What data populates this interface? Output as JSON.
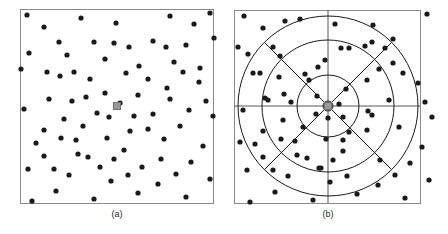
{
  "figure": {
    "title": "",
    "panels": [
      {
        "id": "a",
        "caption": "(a)",
        "description": "uniform scatter of sample points with reference point marker",
        "box": {
          "x": 20,
          "y": 9,
          "width": 193,
          "height": 194
        },
        "border_color": "#8a8a8a",
        "point_color": "#1a1a1a",
        "point_radius": 2.6,
        "center_marker": {
          "x": 117,
          "y": 106,
          "size": 7,
          "fill": "#9a9a9a",
          "stroke": "#6f6f6f"
        }
      },
      {
        "id": "b",
        "caption": "(b)",
        "description": "log-polar bins overlaid on the same sample points",
        "box": {
          "x": 234,
          "y": 10,
          "width": 186,
          "height": 193
        },
        "border_color": "#8a8a8a",
        "point_color": "#1a1a1a",
        "point_radius": 2.6,
        "center_marker": {
          "x": 328,
          "y": 106,
          "size": 7,
          "fill": "#9a9a9a",
          "stroke": "#6f6f6f"
        },
        "grid_color": "#1a1a1a",
        "axis_color": "#555555"
      }
    ]
  },
  "chart_data": {
    "type": "scatter",
    "title": "",
    "subtitle": "",
    "xlabel": "",
    "ylabel": "",
    "grid": false,
    "legend": null,
    "annotations": [
      "(a)",
      "(b)"
    ],
    "panel_a": {
      "xlim": [
        0,
        193
      ],
      "ylim": [
        0,
        194
      ],
      "reference_point": [
        97,
        97
      ],
      "points": [
        [
          150,
          7
        ],
        [
          94,
          34
        ],
        [
          118,
          86
        ],
        [
          166,
          36
        ],
        [
          174,
          15
        ],
        [
          39,
          33
        ],
        [
          74,
          33
        ],
        [
          144,
          130
        ],
        [
          54,
          63
        ],
        [
          194,
          29
        ],
        [
          119,
          57
        ],
        [
          180,
          59
        ],
        [
          85,
          84
        ],
        [
          114,
          107
        ],
        [
          66,
          88
        ],
        [
          147,
          79
        ],
        [
          122,
          158
        ],
        [
          169,
          101
        ],
        [
          106,
          64
        ],
        [
          1,
          60
        ],
        [
          29,
          90
        ],
        [
          44,
          110
        ],
        [
          77,
          104
        ],
        [
          87,
          129
        ],
        [
          24,
          147
        ],
        [
          68,
          148
        ],
        [
          49,
          166
        ],
        [
          91,
          172
        ],
        [
          118,
          184
        ],
        [
          156,
          165
        ],
        [
          183,
          137
        ],
        [
          166,
          188
        ],
        [
          24,
          121
        ],
        [
          56,
          131
        ],
        [
          104,
          141
        ],
        [
          133,
          105
        ],
        [
          160,
          117
        ],
        [
          186,
          92
        ],
        [
          193,
          107
        ],
        [
          179,
          73
        ],
        [
          154,
          53
        ],
        [
          133,
          32
        ],
        [
          96,
          14
        ],
        [
          61,
          9
        ],
        [
          24,
          18
        ],
        [
          9,
          44
        ],
        [
          4,
          100
        ],
        [
          8,
          160
        ],
        [
          36,
          182
        ],
        [
          74,
          190
        ],
        [
          110,
          122
        ],
        [
          89,
          108
        ],
        [
          70,
          70
        ],
        [
          52,
          92
        ],
        [
          40,
          67
        ],
        [
          100,
          94
        ],
        [
          128,
          70
        ],
        [
          150,
          90
        ],
        [
          171,
          153
        ],
        [
          141,
          150
        ],
        [
          108,
          166
        ],
        [
          80,
          158
        ],
        [
          58,
          145
        ],
        [
          34,
          160
        ],
        [
          16,
          134
        ],
        [
          27,
          63
        ],
        [
          47,
          46
        ],
        [
          63,
          117
        ],
        [
          94,
          150
        ],
        [
          128,
          120
        ],
        [
          146,
          38
        ],
        [
          190,
          170
        ],
        [
          7,
          6
        ],
        [
          190,
          4
        ],
        [
          12,
          192
        ],
        [
          163,
          63
        ],
        [
          85,
          50
        ],
        [
          109,
          38
        ],
        [
          41,
          129
        ],
        [
          138,
          175
        ]
      ]
    },
    "panel_b": {
      "xlim": [
        -93,
        93
      ],
      "ylim": [
        -96,
        97
      ],
      "center": [
        0,
        0
      ],
      "bin_radii": [
        5,
        31,
        66,
        90
      ],
      "sector_count": 8,
      "sector_angles_deg": [
        0,
        45,
        90,
        135,
        180,
        225,
        270,
        315
      ],
      "points": [
        [
          -43,
          85
        ],
        [
          13,
          58
        ],
        [
          -11,
          10
        ],
        [
          37,
          60
        ],
        [
          45,
          81
        ],
        [
          -90,
          59
        ],
        [
          -55,
          59
        ],
        [
          15,
          -34
        ],
        [
          -75,
          33
        ],
        [
          65,
          67
        ],
        [
          -10,
          39
        ],
        [
          51,
          37
        ],
        [
          -44,
          12
        ],
        [
          15,
          -11
        ],
        [
          -63,
          8
        ],
        [
          18,
          17
        ],
        [
          -7,
          -62
        ],
        [
          40,
          -5
        ],
        [
          -23,
          32
        ],
        [
          -88,
          -36
        ],
        [
          -60,
          6
        ],
        [
          -45,
          -14
        ],
        [
          -12,
          -8
        ],
        [
          -2,
          -33
        ],
        [
          -65,
          -51
        ],
        [
          -21,
          -52
        ],
        [
          -40,
          -70
        ],
        [
          2,
          -76
        ],
        [
          29,
          -88
        ],
        [
          67,
          -69
        ],
        [
          94,
          -41
        ],
        [
          77,
          -92
        ],
        [
          -65,
          -25
        ],
        [
          -33,
          -35
        ],
        [
          15,
          -45
        ],
        [
          44,
          -9
        ],
        [
          71,
          -21
        ],
        [
          97,
          4
        ],
        [
          104,
          -11
        ],
        [
          90,
          23
        ],
        [
          65,
          43
        ],
        [
          44,
          64
        ],
        [
          7,
          82
        ],
        [
          -28,
          87
        ],
        [
          -65,
          78
        ],
        [
          -80,
          52
        ],
        [
          -85,
          -4
        ],
        [
          -81,
          -64
        ],
        [
          -53,
          -86
        ],
        [
          -15,
          -94
        ],
        [
          21,
          -26
        ],
        [
          0,
          -12
        ],
        [
          -19,
          26
        ],
        [
          -37,
          4
        ],
        [
          -49,
          29
        ],
        [
          11,
          2
        ],
        [
          39,
          26
        ],
        [
          61,
          6
        ],
        [
          82,
          -57
        ],
        [
          52,
          -54
        ],
        [
          19,
          -70
        ],
        [
          -9,
          -62
        ],
        [
          -31,
          -49
        ],
        [
          -55,
          -64
        ],
        [
          -73,
          -38
        ],
        [
          -68,
          33
        ],
        [
          -48,
          50
        ],
        [
          -25,
          -21
        ],
        [
          5,
          -54
        ],
        [
          39,
          -24
        ],
        [
          57,
          58
        ],
        [
          101,
          -74
        ],
        [
          -84,
          90
        ],
        [
          99,
          92
        ],
        [
          -78,
          -96
        ],
        [
          75,
          33
        ],
        [
          -3,
          46
        ],
        [
          21,
          58
        ],
        [
          -47,
          -33
        ],
        [
          50,
          -79
        ]
      ]
    }
  }
}
